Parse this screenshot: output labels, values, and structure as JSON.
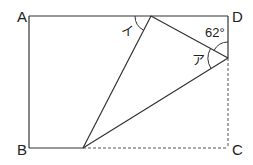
{
  "diagram": {
    "type": "geometry-folded-rectangle",
    "vertices": {
      "A": "A",
      "B": "B",
      "C": "C",
      "D": "D"
    },
    "angle_labels": {
      "a": "ア",
      "i": "イ",
      "given": "62°"
    },
    "colors": {
      "line": "#333333",
      "background": "#ffffff"
    }
  }
}
